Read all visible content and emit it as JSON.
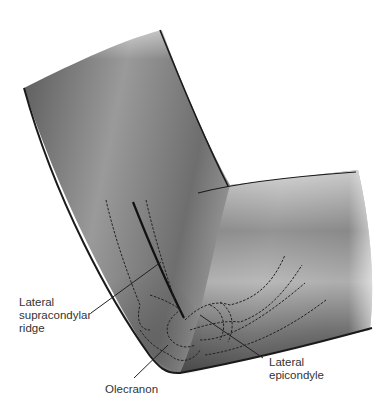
{
  "figure": {
    "labels": [
      {
        "id": "lateral-supracondylar-ridge",
        "lines": [
          "Lateral",
          "supracondylar",
          "ridge"
        ]
      },
      {
        "id": "olecranon",
        "lines": [
          "Olecranon"
        ]
      },
      {
        "id": "lateral-epicondyle",
        "lines": [
          "Lateral",
          "epicondyle"
        ]
      }
    ]
  },
  "colors": {
    "background": "#ffffff",
    "outline": "#1a1a1a",
    "label_text": "#333333",
    "leader_line": "#222222"
  }
}
